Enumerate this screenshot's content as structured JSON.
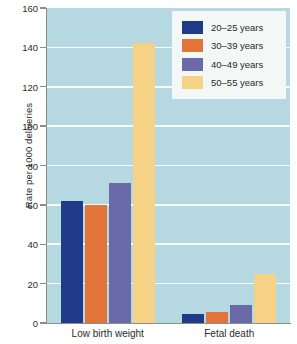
{
  "chart_data": {
    "type": "bar",
    "title": "",
    "xlabel": "",
    "ylabel": "Rate per 1000 deliveries",
    "ylim": [
      0,
      160
    ],
    "ytick_step": 20,
    "yticks": [
      "0",
      "20",
      "40",
      "60",
      "80",
      "100",
      "120",
      "140",
      "160"
    ],
    "grid": true,
    "legend_position": "top-right",
    "categories": [
      "Low birth weight",
      "Fetal death"
    ],
    "series": [
      {
        "name": "20–25 years",
        "color": "#1f3a87",
        "values": [
          62,
          4.5
        ]
      },
      {
        "name": "30–39 years",
        "color": "#e2743a",
        "values": [
          60,
          5.5
        ]
      },
      {
        "name": "40–49 years",
        "color": "#6a6aa8",
        "values": [
          71,
          9
        ]
      },
      {
        "name": "50–55 years",
        "color": "#f5d285",
        "values": [
          142,
          25
        ]
      }
    ]
  },
  "colors": {
    "plot_background": "#b6d9e1",
    "page_background": "#ffffff",
    "gridline": "#ffffff",
    "axis": "#8c8c8c",
    "legend_background": "#f3f7f6",
    "text": "#2b2b2b"
  }
}
